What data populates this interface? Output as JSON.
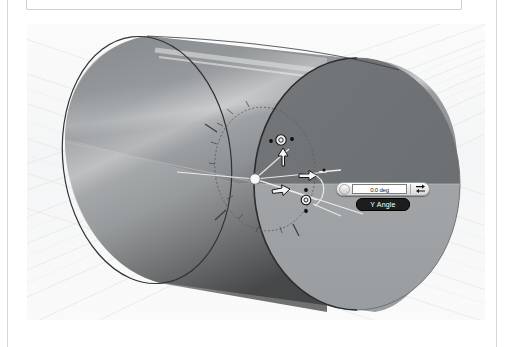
{
  "app": {
    "type": "cad-3d-viewport",
    "scene_description": "3D cylinder with transform manipulator"
  },
  "viewport": {
    "background_color": "#f7f8f8",
    "grid_color": "#e4e6e8",
    "grid_name": "perspective-ground-grid"
  },
  "model": {
    "name": "cylinder",
    "body_top_color": "#8e9193",
    "body_bottom_color": "#a9acad",
    "end_cap_dark_color": "#6f7274",
    "end_cap_light_color": "#a0a3a5",
    "silhouette_color": "#2f3132",
    "highlight_streak_color": "#d5d7d8"
  },
  "manipulator": {
    "name": "triad-rotation-manipulator",
    "origin_handle": "origin-sphere",
    "protractor_ring": "angle-dial-ring",
    "handles": [
      {
        "name": "up-arrow-handle",
        "axis": "Z",
        "glyph": "arrow-up"
      },
      {
        "name": "right-arrow-handle",
        "axis": "X",
        "glyph": "arrow-right"
      },
      {
        "name": "secondary-arrow-handle",
        "axis": "Y",
        "glyph": "arrow-right"
      },
      {
        "name": "top-rotation-ring-handle",
        "glyph": "ring"
      },
      {
        "name": "lower-rotation-ring-handle",
        "glyph": "ring"
      }
    ],
    "handle_fill": "#f2f2f2",
    "handle_stroke": "#151515",
    "dot_color": "#0d0d0d"
  },
  "angle_widget": {
    "name": "y-angle-input-widget",
    "value": "0.0 deg",
    "placeholder": "0.0 deg",
    "label": "Y Angle",
    "grip_name": "drag-grip-handle",
    "action_icon": "flip-direction-icon",
    "label_background": "#1d1d1d",
    "label_text_color": "#ffffff"
  }
}
